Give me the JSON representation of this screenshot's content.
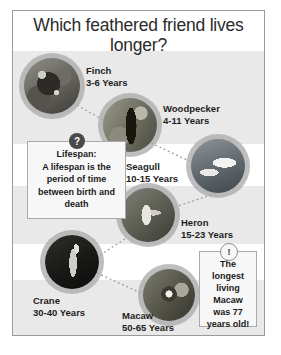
{
  "poster": {
    "title": "Which feathered friend lives longer?",
    "background_color": "#ffffff",
    "band_color": "#e9e9e9",
    "border_color": "#9a9a9a"
  },
  "birds": [
    {
      "name": "Finch",
      "lifespan": "3-6 Years",
      "min_years": 3,
      "max_years": 6
    },
    {
      "name": "Woodpecker",
      "lifespan": "4-11 Years",
      "min_years": 4,
      "max_years": 11
    },
    {
      "name": "Seagull",
      "lifespan": "10-15 Years",
      "min_years": 10,
      "max_years": 15
    },
    {
      "name": "Heron",
      "lifespan": "15-23 Years",
      "min_years": 15,
      "max_years": 23
    },
    {
      "name": "Crane",
      "lifespan": "30-40 Years",
      "min_years": 30,
      "max_years": 40
    },
    {
      "name": "Macaw",
      "lifespan": "50-65 Years",
      "min_years": 50,
      "max_years": 65
    }
  ],
  "definition_box": {
    "badge": "?",
    "title": "Lifespan:",
    "text": "A lifespan is the period of time between birth and death"
  },
  "fact_box": {
    "badge": "!",
    "text": "The longest living Macaw was 77 years old!"
  }
}
